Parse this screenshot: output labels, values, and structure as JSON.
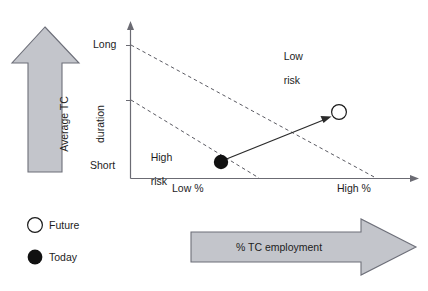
{
  "figure": {
    "axes": {
      "y_axis_top_label": "Long",
      "y_axis_bottom_label": "Short",
      "x_axis_left_label": "Low %",
      "x_axis_right_label": "High %",
      "axis_color": "#6b6b73"
    },
    "regions": [
      {
        "name": "low-risk",
        "label_line1": "Low",
        "label_line2": "risk"
      },
      {
        "name": "high-risk",
        "label_line1": "High",
        "label_line2": "risk"
      }
    ],
    "band_lines": {
      "style": "dashed",
      "color": "#5a5a62",
      "count": 2
    },
    "points": [
      {
        "name": "today",
        "label": "Today",
        "marker": "filled-circle",
        "fill": "#111111",
        "x": 221,
        "y": 162
      },
      {
        "name": "future",
        "label": "Future",
        "marker": "open-circle",
        "fill": "#ffffff",
        "x": 339,
        "y": 112
      }
    ],
    "movement_arrow": {
      "from": "today",
      "to": "future",
      "color": "#2b2b2b"
    },
    "vertical_arrow": {
      "caption_line1": "Average TC",
      "caption_line2": "duration",
      "direction": "up",
      "fill": "#c3c5cb",
      "stroke": "#6d6f79"
    },
    "horizontal_arrow": {
      "caption": "% TC employment",
      "direction": "right",
      "fill": "#c3c5cb",
      "stroke": "#6d6f79"
    },
    "legend": {
      "items": [
        {
          "name": "future",
          "label": "Future",
          "marker": "open-circle"
        },
        {
          "name": "today",
          "label": "Today",
          "marker": "filled-circle"
        }
      ]
    }
  }
}
